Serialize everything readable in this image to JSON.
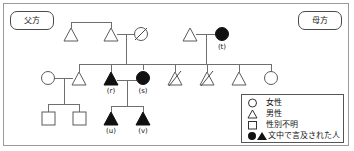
{
  "figure": {
    "paternal_label": "父方",
    "maternal_label": "母方"
  },
  "legend": {
    "rows": [
      {
        "glyph": "circle",
        "label": "女性"
      },
      {
        "glyph": "triangle",
        "label": "男性"
      },
      {
        "glyph": "square",
        "label": "性別不明"
      },
      {
        "glyph": "filled-circle-triangle",
        "label": "文中で言及された人"
      }
    ]
  },
  "persons": {
    "r": "(r)",
    "s": "(s)",
    "t": "(t)",
    "u": "(u)",
    "v": "(v)"
  },
  "colors": {
    "line": "#6f6f6f",
    "shape_stroke": "#5a5a5a",
    "filled": "#111111",
    "border": "#9a9a9a",
    "text": "#111111"
  },
  "pedigree": {
    "generations": 3,
    "symbols": [
      {
        "id": "g1-p-m1",
        "type": "male",
        "filled": false,
        "deceased": false,
        "x": 71,
        "y": 36
      },
      {
        "id": "g1-p-m2",
        "type": "male",
        "filled": false,
        "deceased": false,
        "x": 111,
        "y": 36
      },
      {
        "id": "g1-p-f1",
        "type": "female",
        "filled": false,
        "deceased": true,
        "x": 141,
        "y": 34
      },
      {
        "id": "g1-m-m1",
        "type": "male",
        "filled": false,
        "deceased": false,
        "x": 190,
        "y": 36
      },
      {
        "id": "g1-m-f1",
        "type": "female",
        "filled": true,
        "deceased": false,
        "x": 222,
        "y": 34,
        "label": "t"
      },
      {
        "id": "g2-f-spouse",
        "type": "female",
        "filled": false,
        "deceased": false,
        "x": 48,
        "y": 78
      },
      {
        "id": "g2-m-spouse",
        "type": "male",
        "filled": false,
        "deceased": false,
        "x": 79,
        "y": 80
      },
      {
        "id": "g2-r",
        "type": "male",
        "filled": true,
        "deceased": false,
        "x": 111,
        "y": 80,
        "label": "r"
      },
      {
        "id": "g2-s",
        "type": "female",
        "filled": true,
        "deceased": false,
        "x": 143,
        "y": 78,
        "label": "s"
      },
      {
        "id": "g2-m2",
        "type": "male",
        "filled": false,
        "deceased": true,
        "x": 175,
        "y": 80
      },
      {
        "id": "g2-m3",
        "type": "male",
        "filled": false,
        "deceased": true,
        "x": 207,
        "y": 80
      },
      {
        "id": "g2-m4",
        "type": "male",
        "filled": false,
        "deceased": false,
        "x": 239,
        "y": 80
      },
      {
        "id": "g2-f2",
        "type": "female",
        "filled": false,
        "deceased": false,
        "x": 271,
        "y": 78
      },
      {
        "id": "g3-sq1",
        "type": "unknown",
        "filled": false,
        "deceased": false,
        "x": 48,
        "y": 118
      },
      {
        "id": "g3-sq2",
        "type": "unknown",
        "filled": false,
        "deceased": false,
        "x": 79,
        "y": 118
      },
      {
        "id": "g3-u",
        "type": "male",
        "filled": true,
        "deceased": false,
        "x": 111,
        "y": 120,
        "label": "u"
      },
      {
        "id": "g3-v",
        "type": "male",
        "filled": true,
        "deceased": false,
        "x": 143,
        "y": 120,
        "label": "v"
      }
    ]
  }
}
